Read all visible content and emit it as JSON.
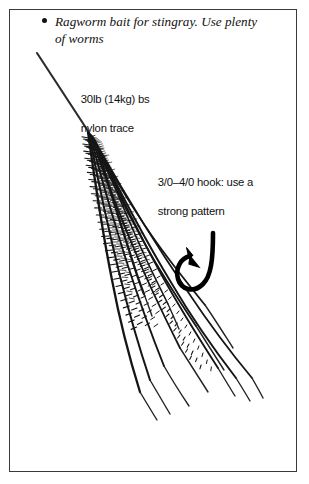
{
  "page": {
    "background_color": "#ffffff",
    "border_color": "#3a3a3a",
    "ink_color": "#111111"
  },
  "caption": {
    "bullet": "bullet-dot",
    "text": "Ragworm bait for stingray. Use plenty of worms"
  },
  "annotations": [
    {
      "name": "trace-label",
      "line1": "30lb (14kg) bs",
      "line2": "nylon trace"
    },
    {
      "name": "hook-label",
      "line1": "3/0–4/0 hook: use a",
      "line2": "strong pattern"
    }
  ],
  "trace_label": {
    "line1": "30lb (14kg) bs",
    "line2": "nylon trace"
  },
  "hook_label": {
    "line1": "3/0–4/0 hook: use a",
    "line2": "strong pattern"
  },
  "illustration": {
    "subject": "ragworm-bait-on-hook",
    "elements": [
      "nylon-trace-line",
      "worm-bundle",
      "fish-hook"
    ],
    "worm_count": 11,
    "hook_color": "#000000",
    "line_color": "#2b2b2b"
  }
}
